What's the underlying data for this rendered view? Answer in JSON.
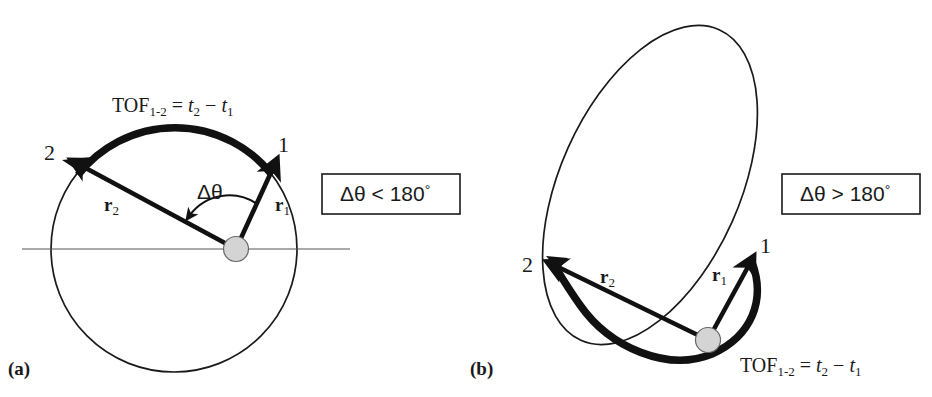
{
  "figure": {
    "background_color": "#ffffff",
    "ink_color": "#1a1a1a",
    "body_fill_color": "#d4d4d4"
  },
  "panel_a": {
    "tag": "(a)",
    "orbit_type": "circle",
    "tof_label": {
      "prefix": "TOF",
      "subscript": "1-2",
      "equals": " = ",
      "t2": "t",
      "t2_sub": "2",
      "minus": " − ",
      "t1": "t",
      "t1_sub": "1"
    },
    "point_1_label": "1",
    "point_2_label": "2",
    "r1_label": "r",
    "r1_subscript": "1",
    "r2_label": "r",
    "r2_subscript": "2",
    "angle_label": "Δθ",
    "annotation_box": {
      "delta_theta": "Δθ",
      "relation": " < ",
      "value": "180",
      "degree": "°"
    }
  },
  "panel_b": {
    "tag": "(b)",
    "orbit_type": "ellipse",
    "tof_label": {
      "prefix": "TOF",
      "subscript": "1-2",
      "equals": " = ",
      "t2": "t",
      "t2_sub": "2",
      "minus": " − ",
      "t1": "t",
      "t1_sub": "1"
    },
    "point_1_label": "1",
    "point_2_label": "2",
    "r1_label": "r",
    "r1_subscript": "1",
    "r2_label": "r",
    "r2_subscript": "2",
    "annotation_box": {
      "delta_theta": "Δθ",
      "relation": " > ",
      "value": "180",
      "degree": "°"
    }
  }
}
